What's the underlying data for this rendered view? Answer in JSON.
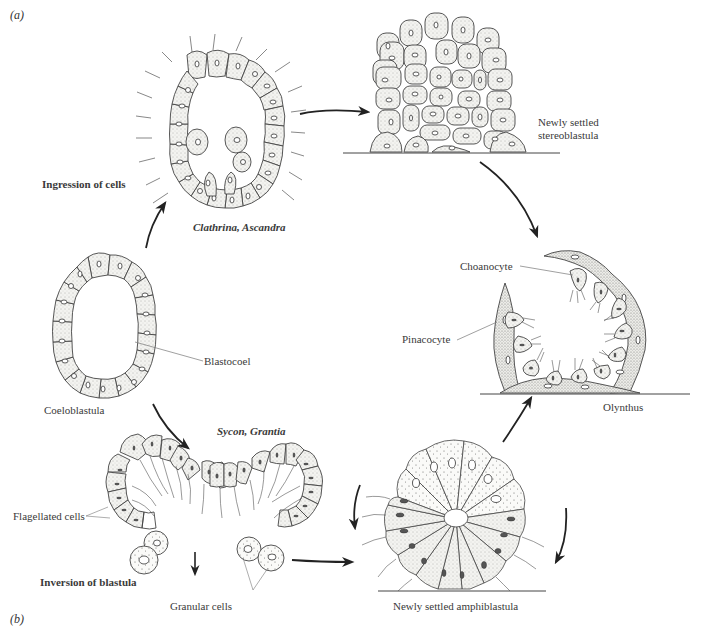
{
  "figure": {
    "panel_a": "(a)",
    "panel_b": "(b)"
  },
  "labels": {
    "ingression": "Ingression of cells",
    "clathrina": "Clathrina, Ascandra",
    "stereoblastula_line1": "Newly settled",
    "stereoblastula_line2": "stereoblastula",
    "choanocyte": "Choanocyte",
    "pinacocyte": "Pinacocyte",
    "olynthus": "Olynthus",
    "blastocoel": "Blastocoel",
    "coeloblastula": "Coeloblastula",
    "sycon": "Sycon, Grantia",
    "flagellated": "Flagellated cells",
    "inversion": "Inversion of blastula",
    "granular": "Granular cells",
    "amphiblastula": "Newly settled amphiblastula"
  },
  "colors": {
    "ink": "#333333",
    "cell_fill": "#f1f1ee",
    "dense_fill": "#e2e2dc",
    "background": "#ffffff"
  }
}
